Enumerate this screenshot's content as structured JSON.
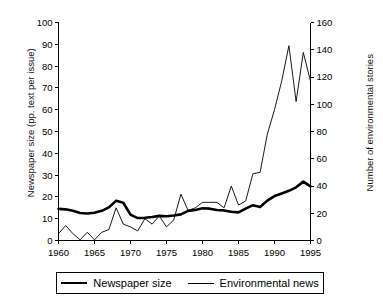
{
  "chart_data": {
    "type": "line",
    "title": "",
    "subtitle": "",
    "xlabel": "",
    "ylabel": "Newspaper size (pp. text per issue)",
    "ylabel_right": "Number of environmental stories",
    "grid": false,
    "legend_position": "bottom",
    "x": [
      1960,
      1961,
      1962,
      1963,
      1964,
      1965,
      1966,
      1967,
      1968,
      1969,
      1970,
      1971,
      1972,
      1973,
      1974,
      1975,
      1976,
      1977,
      1978,
      1979,
      1980,
      1981,
      1982,
      1983,
      1984,
      1985,
      1986,
      1987,
      1988,
      1989,
      1990,
      1991,
      1992,
      1993,
      1994,
      1995
    ],
    "xlim": [
      1960,
      1995
    ],
    "xticks": [
      1960,
      1965,
      1970,
      1975,
      1980,
      1985,
      1990,
      1995
    ],
    "xticklabels": [
      "1960",
      "1965",
      "1970",
      "1975",
      "1980",
      "1985",
      "1990",
      "1995"
    ],
    "ylim": [
      0,
      100
    ],
    "yticks": [
      0,
      10,
      20,
      30,
      40,
      50,
      60,
      70,
      80,
      90,
      100
    ],
    "yticklabels": [
      "0",
      "10",
      "20",
      "30",
      "40",
      "50",
      "60",
      "70",
      "80",
      "90",
      "100"
    ],
    "ylim_right": [
      0,
      160
    ],
    "yticks_right": [
      0,
      20,
      40,
      60,
      80,
      100,
      120,
      140,
      160
    ],
    "yticklabels_right": [
      "0",
      "20",
      "40",
      "60",
      "80",
      "100",
      "120",
      "140",
      "160"
    ],
    "series": [
      {
        "name": "Newspaper size",
        "axis": "left",
        "style": "thick",
        "color": "#000000",
        "values": [
          14.5,
          14.3,
          13.6,
          12.6,
          12.4,
          12.7,
          13.6,
          15.2,
          18.2,
          17.3,
          11.9,
          10.3,
          10.4,
          10.8,
          11.3,
          11.1,
          11.5,
          12.0,
          13.6,
          14.0,
          14.8,
          14.6,
          14.0,
          13.8,
          13.2,
          12.9,
          14.6,
          16.2,
          15.4,
          18.3,
          20.4,
          21.6,
          22.8,
          24.4,
          27.0,
          24.8
        ]
      },
      {
        "name": "Environmental news",
        "axis": "right",
        "style": "thin",
        "color": "#000000",
        "values": [
          5,
          11,
          5,
          0.5,
          6,
          0.5,
          6,
          8,
          24,
          12,
          10,
          7,
          16,
          12,
          18,
          10,
          15,
          34,
          22,
          24,
          28,
          28,
          28,
          24,
          40,
          26,
          29,
          49,
          50,
          78,
          96,
          117,
          143,
          102,
          138,
          117
        ]
      }
    ]
  },
  "legend": {
    "entries": [
      {
        "label": "Newspaper size",
        "style": "thick"
      },
      {
        "label": "Environmental news",
        "style": "thin"
      }
    ]
  }
}
